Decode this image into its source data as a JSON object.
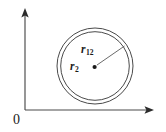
{
  "figure": {
    "type": "vector-diagram",
    "background_color": "#ffffff",
    "stroke_color": "#4a4a4a",
    "text_color": "#1a1a1a"
  },
  "axes": {
    "origin_label": "0",
    "vertical_axis": {
      "name": "y-axis",
      "x": 25,
      "y_top": 12,
      "y_bottom": 110,
      "arrow": "up"
    },
    "horizontal_axis": {
      "name": "x-axis",
      "y": 110,
      "x_left": 25,
      "x_right": 152,
      "arrow": "right"
    }
  },
  "shapes": {
    "outer_circle": {
      "name": "outer-circle",
      "cx": 95,
      "cy": 66,
      "r": 38
    },
    "inner_circle": {
      "name": "inner-circle",
      "cx": 95,
      "cy": 66,
      "r": 34.5
    },
    "center_point": {
      "name": "center-point",
      "cx": 94.5,
      "cy": 67,
      "r": 2.0
    },
    "radius_vector": {
      "name": "radius-vector",
      "x1": 96,
      "y1": 66,
      "x2": 124,
      "y2": 46
    }
  },
  "labels": {
    "r12": {
      "base": "r",
      "subscript": "12",
      "full": "r12"
    },
    "r2": {
      "base": "r",
      "subscript": "2",
      "full": "r2"
    }
  }
}
